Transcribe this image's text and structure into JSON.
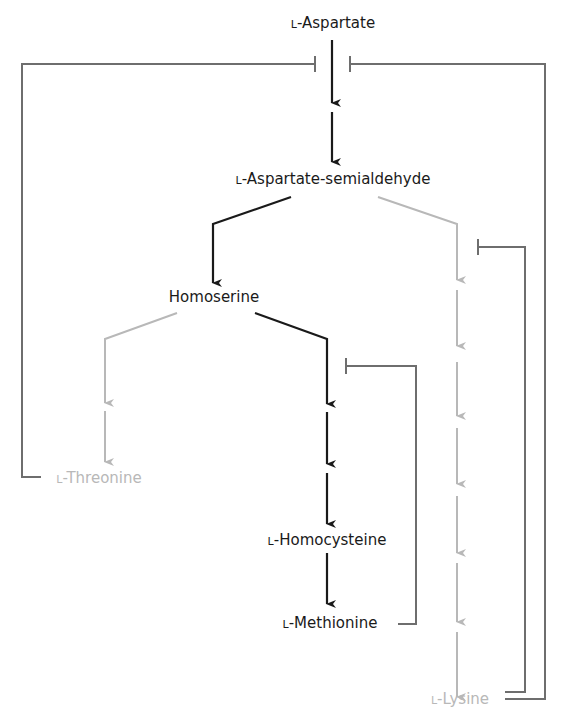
{
  "colors": {
    "main_pathway": "#1a1a1a",
    "side_pathway": "#b8b8b8",
    "feedback": "#6e6e6e",
    "background": "#ffffff"
  },
  "nodes": {
    "aspartate": {
      "prefix": "L",
      "name": "-Aspartate",
      "style": "dark"
    },
    "semialdehyde": {
      "prefix": "L",
      "name": "-Aspartate-semialdehyde",
      "style": "dark"
    },
    "homoserine": {
      "prefix": "",
      "name": "Homoserine",
      "style": "dark"
    },
    "threonine": {
      "prefix": "L",
      "name": "-Threonine",
      "style": "light"
    },
    "homocysteine": {
      "prefix": "L",
      "name": "-Homocysteine",
      "style": "dark"
    },
    "methionine": {
      "prefix": "L",
      "name": "-Methionine",
      "style": "dark"
    },
    "lysine": {
      "prefix": "L",
      "name": "-Lysine",
      "style": "light"
    }
  },
  "edges": [
    {
      "from": "L-Aspartate",
      "to": "L-Aspartate-semialdehyde",
      "steps": 2,
      "style": "dark"
    },
    {
      "from": "L-Aspartate-semialdehyde",
      "to": "Homoserine",
      "steps": 1,
      "style": "dark"
    },
    {
      "from": "L-Aspartate-semialdehyde",
      "to": "L-Lysine",
      "steps": 6,
      "style": "light"
    },
    {
      "from": "Homoserine",
      "to": "L-Threonine",
      "steps": 2,
      "style": "light"
    },
    {
      "from": "Homoserine",
      "to": "L-Homocysteine",
      "steps": 3,
      "style": "dark"
    },
    {
      "from": "L-Homocysteine",
      "to": "L-Methionine",
      "steps": 1,
      "style": "dark"
    }
  ],
  "feedback_inhibition": [
    {
      "inhibitor": "L-Threonine",
      "target": "L-Aspartate -> L-Aspartate-semialdehyde (step 1)"
    },
    {
      "inhibitor": "L-Lysine",
      "target": "L-Aspartate -> L-Aspartate-semialdehyde (step 1)"
    },
    {
      "inhibitor": "L-Lysine",
      "target": "L-Aspartate-semialdehyde -> L-Lysine (step 1)"
    },
    {
      "inhibitor": "L-Methionine",
      "target": "Homoserine -> L-Homocysteine (step 1)"
    }
  ]
}
